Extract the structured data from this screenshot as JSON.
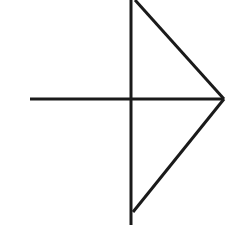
{
  "diagram": {
    "background": "#ffffff",
    "stroke_color": "#1a1a1a",
    "stroke_width": 3,
    "segments": [
      {
        "name": "vertical-axis-line",
        "x1": 131,
        "y1": 0,
        "x2": 131,
        "y2": 225
      },
      {
        "name": "horizontal-axis-line",
        "x1": 30,
        "y1": 99,
        "x2": 224,
        "y2": 99
      },
      {
        "name": "upper-diagonal-line",
        "x1": 135,
        "y1": 0,
        "x2": 224,
        "y2": 99
      },
      {
        "name": "lower-diagonal-line",
        "x1": 224,
        "y1": 99,
        "x2": 133,
        "y2": 212
      }
    ]
  }
}
